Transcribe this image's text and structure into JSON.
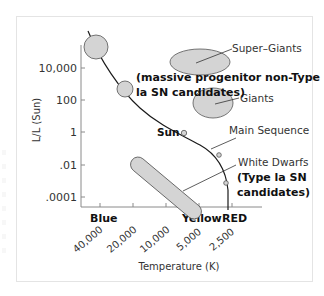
{
  "diagram": {
    "y_axis": {
      "label": "L/L (Sun)",
      "ticks": [
        "10,000",
        "100",
        "1",
        ".01",
        ".0001"
      ]
    },
    "x_axis": {
      "label": "Temperature (K)",
      "ticks": [
        "40,000",
        "20,000",
        "10,000",
        "5,000",
        "2,500"
      ],
      "color_labels": {
        "blue": "Blue",
        "yellow": "Yellow",
        "red": "RED"
      }
    },
    "regions": {
      "super_giants": "Super–Giants",
      "giants": "Giants",
      "main_sequence": "Main Sequence",
      "white_dwarfs": "White Dwarfs",
      "sun": "Sun"
    },
    "annotations": {
      "massive_line1": "(massive progenitor non-Type",
      "massive_line2": "la SN candidates)",
      "wd_line1": "(Type la SN",
      "wd_line2": "candidates)"
    },
    "colors": {
      "fill": "#d4d4d4",
      "stroke": "#555555",
      "curve": "#1a1a1a",
      "axis": "#888888"
    }
  }
}
